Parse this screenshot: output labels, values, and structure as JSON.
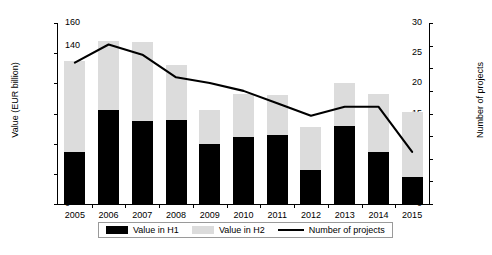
{
  "chart_data": {
    "type": "bar",
    "title": "",
    "subtitle": "",
    "xlabel": "",
    "ylabel": "Value (EUR billion)",
    "ylabel_right": "Number of projects",
    "grid": false,
    "legend_position": "bottom",
    "categories": [
      "2005",
      "2006",
      "2007",
      "2008",
      "2009",
      "2010",
      "2011",
      "2012",
      "2013",
      "2014",
      "2015"
    ],
    "ylim": [
      0,
      30
    ],
    "yticks": [
      0,
      5,
      10,
      15,
      20,
      25,
      30
    ],
    "ylim_right": [
      0,
      160
    ],
    "yticks_right": [
      0,
      20,
      40,
      60,
      80,
      100,
      120,
      140,
      160
    ],
    "series": [
      {
        "name": "Value in H1",
        "type": "bar",
        "axis": "left",
        "color": "#000000",
        "values": [
          8.6,
          15.5,
          13.7,
          14.0,
          9.9,
          11.1,
          11.5,
          5.6,
          12.9,
          8.6,
          4.4
        ]
      },
      {
        "name": "Value in H2",
        "type": "bar",
        "axis": "left",
        "color": "#dcdcdc",
        "stacked_on": "Value in H1",
        "values": [
          15.1,
          11.5,
          13.1,
          9.1,
          5.7,
          7.1,
          6.6,
          7.1,
          7.2,
          9.6,
          10.8
        ]
      },
      {
        "name": "Value total",
        "type": "bar-total",
        "axis": "left",
        "values": [
          23.7,
          27.0,
          26.8,
          23.1,
          15.6,
          18.2,
          18.1,
          12.7,
          20.1,
          18.2,
          15.2
        ]
      },
      {
        "name": "Number of projects",
        "type": "line",
        "axis": "right",
        "color": "#000000",
        "values": [
          125,
          141,
          132,
          112,
          107,
          100,
          89,
          78,
          86,
          86,
          46
        ]
      }
    ],
    "annotations": []
  },
  "legend": {
    "items": [
      {
        "label": "Value in H1",
        "marker": "filled-black-rect"
      },
      {
        "label": "Value in H2",
        "marker": "filled-gray-rect"
      },
      {
        "label": "Number of projects",
        "marker": "black-line"
      }
    ]
  },
  "caption_remnant": ""
}
